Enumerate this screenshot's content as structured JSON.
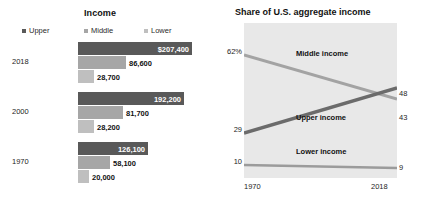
{
  "bar_chart": {
    "title": "Income",
    "legend": [
      {
        "label": "Upper",
        "color": "#595959"
      },
      {
        "label": "Middle",
        "color": "#a6a6a6"
      },
      {
        "label": "Lower",
        "color": "#bfbfbf"
      }
    ],
    "groups": [
      {
        "year": "2018",
        "bars": [
          {
            "series": "Upper",
            "value": 207400,
            "label": "$207,400",
            "width_px": 114,
            "color": "#595959",
            "label_inside": true
          },
          {
            "series": "Middle",
            "value": 86600,
            "label": "86,600",
            "width_px": 48,
            "color": "#a6a6a6",
            "label_inside": false
          },
          {
            "series": "Lower",
            "value": 28700,
            "label": "28,700",
            "width_px": 16,
            "color": "#bfbfbf",
            "label_inside": false
          }
        ]
      },
      {
        "year": "2000",
        "bars": [
          {
            "series": "Upper",
            "value": 192200,
            "label": "192,200",
            "width_px": 106,
            "color": "#595959",
            "label_inside": true
          },
          {
            "series": "Middle",
            "value": 81700,
            "label": "81,700",
            "width_px": 45,
            "color": "#a6a6a6",
            "label_inside": false
          },
          {
            "series": "Lower",
            "value": 28200,
            "label": "28,200",
            "width_px": 16,
            "color": "#bfbfbf",
            "label_inside": false
          }
        ]
      },
      {
        "year": "1970",
        "bars": [
          {
            "series": "Upper",
            "value": 126100,
            "label": "126,100",
            "width_px": 70,
            "color": "#595959",
            "label_inside": true
          },
          {
            "series": "Middle",
            "value": 58100,
            "label": "58,100",
            "width_px": 32,
            "color": "#a6a6a6",
            "label_inside": false
          },
          {
            "series": "Lower",
            "value": 20000,
            "label": "20,000",
            "width_px": 11,
            "color": "#bfbfbf",
            "label_inside": false
          }
        ]
      }
    ]
  },
  "line_chart": {
    "title": "Share of U.S. aggregate income",
    "x_start_label": "1970",
    "x_end_label": "2018",
    "plot_bg": "#e8e8e8",
    "series": [
      {
        "name": "Middle income",
        "start_label": "62%",
        "end_label": "43",
        "start_value": 62,
        "end_value": 43,
        "color": "#a3a3a3"
      },
      {
        "name": "Upper income",
        "start_label": "29",
        "end_label": "48",
        "start_value": 29,
        "end_value": 48,
        "color": "#6b6b6b"
      },
      {
        "name": "Lower income",
        "start_label": "10",
        "end_label": "9",
        "start_value": 10,
        "end_value": 9,
        "color": "#9b9b9b"
      }
    ]
  },
  "chart_data": [
    {
      "type": "bar",
      "title": "Income",
      "orientation": "horizontal",
      "categories": [
        "2018",
        "2000",
        "1970"
      ],
      "series": [
        {
          "name": "Upper",
          "values": [
            207400,
            192200,
            126100
          ]
        },
        {
          "name": "Middle",
          "values": [
            86600,
            81700,
            58100
          ]
        },
        {
          "name": "Lower",
          "values": [
            28700,
            28200,
            20000
          ]
        }
      ],
      "data_labels": [
        [
          "$207,400",
          "86,600",
          "28,700"
        ],
        [
          "192,200",
          "81,700",
          "28,200"
        ],
        [
          "126,100",
          "58,100",
          "20,000"
        ]
      ],
      "xlabel": "",
      "ylabel": "",
      "legend_position": "top",
      "grid": false
    },
    {
      "type": "line",
      "title": "Share of U.S. aggregate income",
      "x": [
        1970,
        2018
      ],
      "xtick_labels": [
        "1970",
        "2018"
      ],
      "series": [
        {
          "name": "Middle income",
          "values": [
            62,
            43
          ]
        },
        {
          "name": "Upper income",
          "values": [
            29,
            48
          ]
        },
        {
          "name": "Lower income",
          "values": [
            10,
            9
          ]
        }
      ],
      "ytick_labels_left": [
        "62%",
        "29",
        "10"
      ],
      "ytick_labels_right": [
        "48",
        "43",
        "9"
      ],
      "ylim": [
        0,
        70
      ],
      "xlabel": "",
      "ylabel": "",
      "legend_position": "inline-labels",
      "grid": false
    }
  ]
}
